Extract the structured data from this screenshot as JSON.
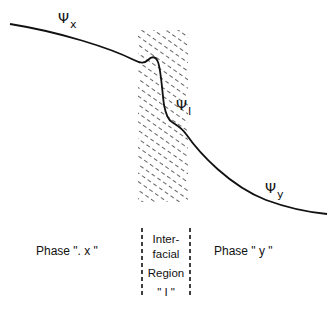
{
  "diagram": {
    "curve_labels": {
      "psi_x": {
        "symbol": "Ψ",
        "subscript": "x"
      },
      "psi_i": {
        "symbol": "Ψ",
        "subscript": "I"
      },
      "psi_y": {
        "symbol": "Ψ",
        "subscript": "y"
      }
    },
    "regions": {
      "phase_x": "Phase \". x \"",
      "interfacial": [
        "Inter-",
        "facial",
        "Region",
        "\" I \""
      ],
      "phase_y": "Phase \" y \""
    }
  }
}
